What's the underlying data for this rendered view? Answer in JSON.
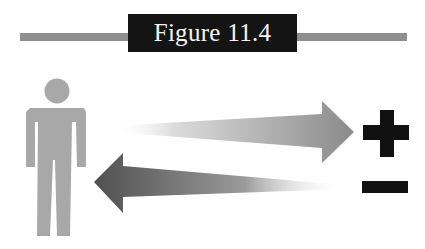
{
  "figure": {
    "title": "Figure 11.4",
    "header_bar_color": "#8f8f8f",
    "title_box_color": "#141414",
    "title_text_color": "#f4f4f4"
  },
  "diagram": {
    "person": {
      "icon": "person-icon",
      "color": "#a8a8a8"
    },
    "arrow_outgoing": {
      "icon": "arrow-right-icon",
      "direction": "right",
      "target": "plus",
      "gradient": [
        "#ffffff",
        "#8a8a8a"
      ]
    },
    "arrow_incoming": {
      "icon": "arrow-left-icon",
      "direction": "left",
      "source": "minus",
      "gradient": [
        "#505050",
        "#ffffff"
      ]
    },
    "plus_symbol": {
      "icon": "plus-icon",
      "label": "+",
      "color": "#111111"
    },
    "minus_symbol": {
      "icon": "minus-icon",
      "label": "−",
      "color": "#111111"
    }
  }
}
